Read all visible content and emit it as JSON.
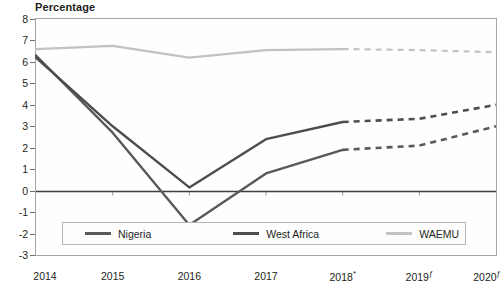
{
  "chart_data": {
    "type": "line",
    "title": "Percentage",
    "xlabel": "",
    "ylabel": "Percentage",
    "ylim": [
      -3,
      8
    ],
    "ytick_labels": [
      "8",
      "7",
      "6",
      "5",
      "4",
      "3",
      "2",
      "1",
      "0",
      "-1",
      "-2",
      "-3"
    ],
    "ytick_values": [
      8,
      7,
      6,
      5,
      4,
      3,
      2,
      1,
      0,
      -1,
      -2,
      -3
    ],
    "categories": [
      "2014",
      "2015",
      "2016",
      "2017",
      "2018*",
      "2019ƒ",
      "2020ƒ"
    ],
    "x": [
      2014,
      2015,
      2016,
      2017,
      2018,
      2019,
      2020
    ],
    "grid": false,
    "zero_line": true,
    "legend_position": "bottom-inside",
    "forecast_start_index": 4,
    "forecast_note": "Values from 2018 onward are shown as dashed (estimate/forecast)",
    "series": [
      {
        "name": "Nigeria",
        "color": "#595959",
        "values": [
          6.3,
          2.7,
          -1.6,
          0.8,
          1.9,
          2.1,
          3.0
        ]
      },
      {
        "name": "West Africa",
        "color": "#4d4d4d",
        "values": [
          6.2,
          3.0,
          0.15,
          2.4,
          3.2,
          3.35,
          4.0
        ]
      },
      {
        "name": "WAEMU",
        "color": "#c2c2c2",
        "values": [
          6.6,
          6.75,
          6.2,
          6.55,
          6.6,
          6.55,
          6.45
        ]
      }
    ]
  },
  "legend": {
    "items": [
      {
        "label": "Nigeria",
        "color": "#595959"
      },
      {
        "label": "West Africa",
        "color": "#4d4d4d"
      },
      {
        "label": "WAEMU",
        "color": "#c2c2c2"
      }
    ]
  },
  "colors": {
    "frame": "#a6a6a6",
    "zero_line": "#3f3f3f",
    "text": "#231f20",
    "background": "#ffffff"
  }
}
